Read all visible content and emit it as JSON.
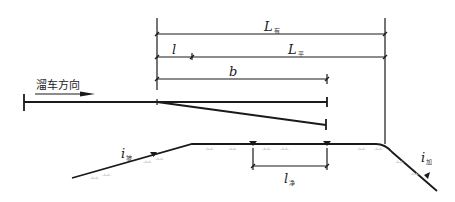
{
  "diagram": {
    "direction_label": "溜车方向",
    "dimensions": {
      "L_eff": {
        "symbol": "L",
        "subscript": "有"
      },
      "L_flat": {
        "symbol": "L",
        "subscript": "平"
      },
      "l": {
        "symbol": "l"
      },
      "b": {
        "symbol": "b"
      },
      "l_net": {
        "symbol": "l",
        "subscript": "净"
      }
    },
    "grades": {
      "i_slope": {
        "symbol": "i",
        "subscript": "坡"
      },
      "i_add": {
        "symbol": "i",
        "subscript": "加"
      }
    },
    "hatch_mark": "䒑"
  }
}
